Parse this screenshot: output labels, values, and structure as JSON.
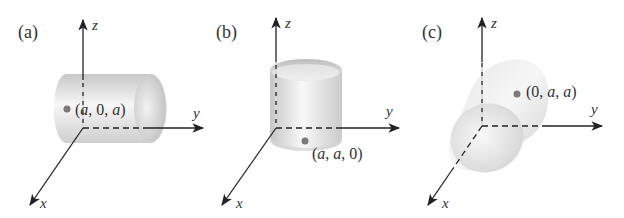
{
  "figure": {
    "panels": [
      {
        "id": "a",
        "label": "(a)",
        "cylinder_orientation": "parallel to y-axis",
        "point": {
          "label_open": "(",
          "c1": "a",
          "sep1": ", ",
          "c2": "0",
          "sep2": ", ",
          "c3": "a",
          "label_close": ")"
        },
        "axes": {
          "x": "x",
          "y": "y",
          "z": "z"
        }
      },
      {
        "id": "b",
        "label": "(b)",
        "cylinder_orientation": "parallel to z-axis",
        "point": {
          "label_open": "(",
          "c1": "a",
          "sep1": ", ",
          "c2": "a",
          "sep2": ", ",
          "c3": "0",
          "label_close": ")"
        },
        "axes": {
          "x": "x",
          "y": "y",
          "z": "z"
        }
      },
      {
        "id": "c",
        "label": "(c)",
        "cylinder_orientation": "parallel to x-axis",
        "point": {
          "label_open": "(",
          "c1": "0",
          "sep1": ", ",
          "c2": "a",
          "sep2": ", ",
          "c3": "a",
          "label_close": ")"
        },
        "axes": {
          "x": "x",
          "y": "y",
          "z": "z"
        }
      }
    ],
    "colors": {
      "axis": "#222222",
      "point": "#7a7a7a",
      "text": "#333333",
      "cylinder_light": "#f4f4f4",
      "cylinder_dark": "#bdbdbd"
    }
  }
}
